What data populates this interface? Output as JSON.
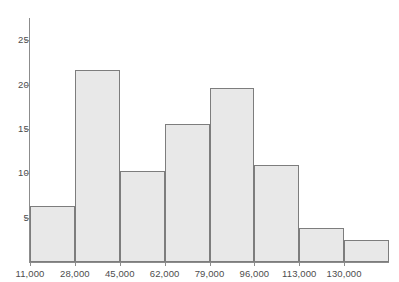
{
  "chart_data": {
    "type": "bar",
    "title": "",
    "subtitle": "",
    "xlabel": "",
    "ylabel": "",
    "grid": false,
    "legend": false,
    "legend_position": "none",
    "bar_fill_color": "#e8e8e8",
    "bar_edge_color": "#7d7d7d",
    "axis_color": "#8c8c8c",
    "text_color": "#4d4d4d",
    "xlim": [
      11000,
      147000
    ],
    "ylim": [
      0,
      27.5
    ],
    "yticks": [
      5,
      10,
      15,
      20,
      25
    ],
    "ytick_labels": [
      "5",
      "10",
      "15",
      "20",
      "25"
    ],
    "xticks": [
      11000,
      28000,
      45000,
      62000,
      79000,
      96000,
      113000,
      130000
    ],
    "xtick_labels": [
      "11,000",
      "28,000",
      "45,000",
      "62,000",
      "79,000",
      "96,000",
      "113,000",
      "130,000"
    ],
    "bin_width": 17000,
    "categories": [
      "11,000-28,000",
      "28,000-45,000",
      "45,000-62,000",
      "62,000-79,000",
      "79,000-96,000",
      "96,000-113,000",
      "113,000-130,000",
      "130,000-147,000"
    ],
    "bin_edges": [
      11000,
      28000,
      45000,
      62000,
      79000,
      96000,
      113000,
      130000,
      147000
    ],
    "values": [
      6.3,
      21.6,
      10.3,
      15.5,
      19.6,
      10.9,
      3.8,
      2.5
    ],
    "annotations": []
  }
}
